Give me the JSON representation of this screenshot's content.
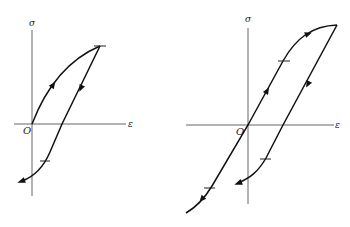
{
  "diagrams": [
    {
      "id": "left",
      "description": "Stress-strain loop: loading from origin to peak, unloading and reverse loading",
      "axes": {
        "y_label": "σ",
        "x_label": "ε",
        "origin_label": "O"
      },
      "ticks": 2,
      "arrows": 3
    },
    {
      "id": "right",
      "description": "Stress-strain hysteresis loop with loading from negative region through origin to peak, then unloading",
      "axes": {
        "y_label": "σ",
        "x_label": "ε",
        "origin_label": "O"
      },
      "ticks": 3,
      "arrows": 4
    }
  ],
  "colors": {
    "curve": "#111111",
    "axis": "#555555",
    "background": "#ffffff"
  }
}
